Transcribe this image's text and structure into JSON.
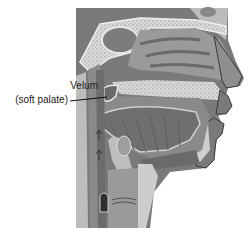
{
  "figure": {
    "labels": [
      {
        "id": "velum",
        "line1": "Velum",
        "line2": "(soft palate)",
        "points_to": "soft palate"
      }
    ]
  },
  "colors": {
    "background": "#ffffff",
    "tissue_dark": "#6e6e6e",
    "tissue_mid": "#8a8a8a",
    "tissue_light": "#a9a9a9",
    "bone": "#d6d6d6",
    "bone_dots": "#9a9a9a",
    "outline": "#3a3a3a",
    "text": "#222222"
  }
}
